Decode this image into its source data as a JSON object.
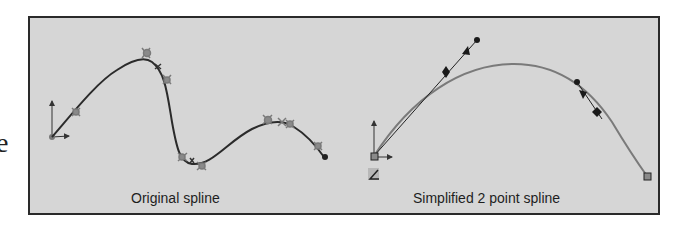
{
  "page": {
    "edge_text": "e"
  },
  "figure": {
    "background": "#d6d6d6",
    "border": "#2a2a2a",
    "panels": [
      {
        "id": "original",
        "caption": "Original spline",
        "curve_color": "#2b2b2b",
        "marker_color": "#7a7a7a",
        "icons": [
          "origin-axes-icon",
          "spline-point-markers",
          "spline-end-dot"
        ]
      },
      {
        "id": "simplified",
        "caption": "Simplified 2 point spline",
        "curve_color": "#7a7a7a",
        "handle_color": "#1a1a1a",
        "icons": [
          "origin-axes-icon",
          "start-point-square",
          "end-point-square",
          "tangent-handle",
          "angle-icon"
        ]
      }
    ]
  }
}
